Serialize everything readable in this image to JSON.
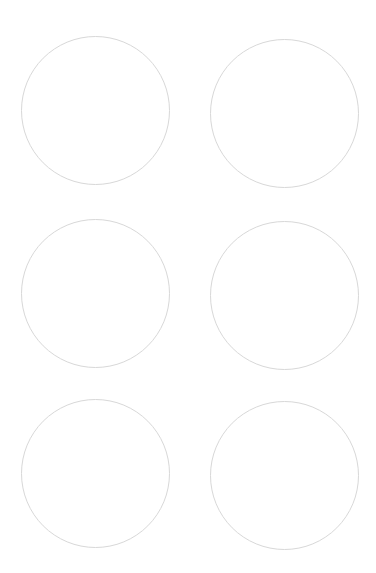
{
  "document": {
    "kind": "round-label-sheet-template",
    "title": "Blank Round Label Sheet",
    "page_width_px": 376,
    "page_height_px": 573,
    "background_color": "#ffffff",
    "outline_color": "#d8d8d8",
    "outline_width_px": 1,
    "columns": 2,
    "rows": 3,
    "label_count": 6,
    "label_diameter_px": 149,
    "column_gap_px": 40,
    "row_gap_px": 33,
    "margin_left_px": 21,
    "margin_top_px": 36
  },
  "labels": [
    {
      "id": "label-1",
      "row": 1,
      "column": 1,
      "text": "",
      "left_px": 21,
      "top_px": 36,
      "diameter_px": 149
    },
    {
      "id": "label-2",
      "row": 1,
      "column": 2,
      "text": "",
      "left_px": 210,
      "top_px": 39,
      "diameter_px": 149
    },
    {
      "id": "label-3",
      "row": 2,
      "column": 1,
      "text": "",
      "left_px": 21,
      "top_px": 219,
      "diameter_px": 149
    },
    {
      "id": "label-4",
      "row": 2,
      "column": 2,
      "text": "",
      "left_px": 210,
      "top_px": 221,
      "diameter_px": 149
    },
    {
      "id": "label-5",
      "row": 3,
      "column": 1,
      "text": "",
      "left_px": 21,
      "top_px": 399,
      "diameter_px": 149
    },
    {
      "id": "label-6",
      "row": 3,
      "column": 2,
      "text": "",
      "left_px": 210,
      "top_px": 401,
      "diameter_px": 149
    }
  ]
}
